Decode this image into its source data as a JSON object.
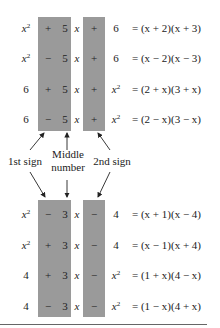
{
  "diagram": {
    "top_rows": [
      {
        "term1": "x",
        "term1_sup": "2",
        "sign1": "+",
        "middle": "5",
        "var": "x",
        "sign2": "+",
        "term3": "6",
        "term3_sup": "",
        "rhs": "= (x + 2)(x + 3)"
      },
      {
        "term1": "x",
        "term1_sup": "2",
        "sign1": "−",
        "middle": "5",
        "var": "x",
        "sign2": "+",
        "term3": "6",
        "term3_sup": "",
        "rhs": "= (x − 2)(x − 3)"
      },
      {
        "term1": "6",
        "term1_sup": "",
        "sign1": "+",
        "middle": "5",
        "var": "x",
        "sign2": "+",
        "term3": "x",
        "term3_sup": "2",
        "rhs": "= (2 + x)(3 + x)"
      },
      {
        "term1": "6",
        "term1_sup": "",
        "sign1": "−",
        "middle": "5",
        "var": "x",
        "sign2": "+",
        "term3": "x",
        "term3_sup": "2",
        "rhs": "= (2 − x)(3 − x)"
      }
    ],
    "bottom_rows": [
      {
        "term1": "x",
        "term1_sup": "2",
        "sign1": "−",
        "middle": "3",
        "var": "x",
        "sign2": "−",
        "term3": "4",
        "term3_sup": "",
        "rhs": "= (x + 1)(x − 4)"
      },
      {
        "term1": "x",
        "term1_sup": "2",
        "sign1": "+",
        "middle": "3",
        "var": "x",
        "sign2": "−",
        "term3": "4",
        "term3_sup": "",
        "rhs": "= (x − 1)(x + 4)"
      },
      {
        "term1": "4",
        "term1_sup": "",
        "sign1": "+",
        "middle": "3",
        "var": "x",
        "sign2": "−",
        "term3": "x",
        "term3_sup": "2",
        "rhs": "= (1 + x)(4 − x)"
      },
      {
        "term1": "4",
        "term1_sup": "",
        "sign1": "−",
        "middle": "3",
        "var": "x",
        "sign2": "−",
        "term3": "x",
        "term3_sup": "2",
        "rhs": "= (1 − x)(4 + x)"
      }
    ],
    "labels": {
      "first_sign": "1st sign",
      "middle_line1": "Middle",
      "middle_line2": "number",
      "second_sign": "2nd sign"
    },
    "colors": {
      "highlight_box": "#9a9a9a",
      "text": "#222222",
      "rule": "#666666"
    }
  }
}
